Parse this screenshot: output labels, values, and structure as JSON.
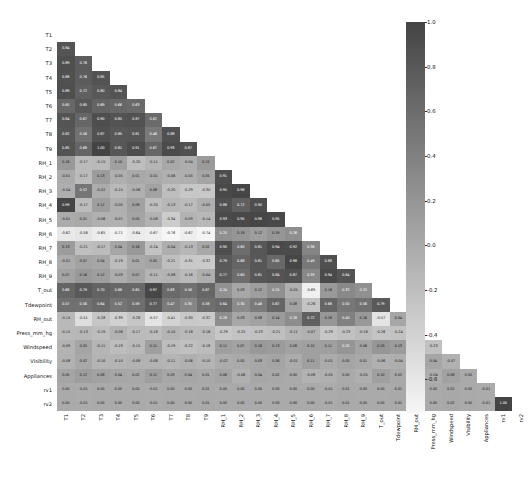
{
  "chart_data": {
    "type": "heatmap",
    "title": "",
    "xlabel": "",
    "ylabel": "",
    "mask": "lower-triangle",
    "annotated": true,
    "colormap": "grayscale-dark-high",
    "colorbar": {
      "vmin": -0.75,
      "vmax": 1.0,
      "ticks": [
        "1.0",
        "0.8",
        "0.6",
        "0.4",
        "0.2",
        "0.0",
        "-0.2",
        "-0.4",
        "-0.6"
      ],
      "tick_values": [
        1.0,
        0.8,
        0.6,
        0.4,
        0.2,
        0.0,
        -0.2,
        -0.4,
        -0.6
      ],
      "position": "right",
      "color_high": "#4a4a4a",
      "color_low": "#f2f2f2"
    },
    "categories": [
      "T1",
      "T2",
      "T3",
      "T4",
      "T5",
      "T6",
      "T7",
      "T8",
      "T9",
      "RH_1",
      "RH_2",
      "RH_3",
      "RH_4",
      "RH_5",
      "RH_6",
      "RH_7",
      "RH_8",
      "RH_9",
      "T_out",
      "Tdewpoint",
      "RH_out",
      "Press_mm_hg",
      "Windspeed",
      "Visibility",
      "Appliances",
      "rv1",
      "rv2"
    ],
    "matrix": [
      [
        null,
        null,
        null,
        null,
        null,
        null,
        null,
        null,
        null,
        null,
        null,
        null,
        null,
        null,
        null,
        null,
        null,
        null,
        null,
        null,
        null,
        null,
        null,
        null,
        null,
        null,
        null
      ],
      [
        0.84,
        null,
        null,
        null,
        null,
        null,
        null,
        null,
        null,
        null,
        null,
        null,
        null,
        null,
        null,
        null,
        null,
        null,
        null,
        null,
        null,
        null,
        null,
        null,
        null,
        null,
        null
      ],
      [
        0.89,
        0.76,
        null,
        null,
        null,
        null,
        null,
        null,
        null,
        null,
        null,
        null,
        null,
        null,
        null,
        null,
        null,
        null,
        null,
        null,
        null,
        null,
        null,
        null,
        null,
        null,
        null
      ],
      [
        0.88,
        0.76,
        0.85,
        null,
        null,
        null,
        null,
        null,
        null,
        null,
        null,
        null,
        null,
        null,
        null,
        null,
        null,
        null,
        null,
        null,
        null,
        null,
        null,
        null,
        null,
        null,
        null
      ],
      [
        0.89,
        0.72,
        0.8,
        0.84,
        null,
        null,
        null,
        null,
        null,
        null,
        null,
        null,
        null,
        null,
        null,
        null,
        null,
        null,
        null,
        null,
        null,
        null,
        null,
        null,
        null,
        null,
        null
      ],
      [
        0.65,
        0.8,
        0.69,
        0.66,
        0.63,
        null,
        null,
        null,
        null,
        null,
        null,
        null,
        null,
        null,
        null,
        null,
        null,
        null,
        null,
        null,
        null,
        null,
        null,
        null,
        null,
        null,
        null
      ],
      [
        0.84,
        0.67,
        0.9,
        0.85,
        0.87,
        0.62,
        null,
        null,
        null,
        null,
        null,
        null,
        null,
        null,
        null,
        null,
        null,
        null,
        null,
        null,
        null,
        null,
        null,
        null,
        null,
        null,
        null
      ],
      [
        0.82,
        0.56,
        0.87,
        0.8,
        0.81,
        0.48,
        0.88,
        null,
        null,
        null,
        null,
        null,
        null,
        null,
        null,
        null,
        null,
        null,
        null,
        null,
        null,
        null,
        null,
        null,
        null,
        null,
        null
      ],
      [
        0.85,
        0.68,
        1.0,
        0.81,
        0.91,
        0.67,
        0.93,
        0.87,
        null,
        null,
        null,
        null,
        null,
        null,
        null,
        null,
        null,
        null,
        null,
        null,
        null,
        null,
        null,
        null,
        null,
        null,
        null
      ],
      [
        0.16,
        -0.17,
        -0.15,
        0.1,
        -0.2,
        -0.11,
        0.02,
        -0.04,
        0.15,
        null,
        null,
        null,
        null,
        null,
        null,
        null,
        null,
        null,
        null,
        null,
        null,
        null,
        null,
        null,
        null,
        null,
        null
      ],
      [
        -0.01,
        -0.17,
        0.13,
        -0.05,
        0.01,
        -0.01,
        -0.06,
        -0.05,
        0.05,
        0.91,
        null,
        null,
        null,
        null,
        null,
        null,
        null,
        null,
        null,
        null,
        null,
        null,
        null,
        null,
        null,
        null,
        null
      ],
      [
        -0.04,
        0.52,
        -0.02,
        -0.15,
        -0.06,
        0.08,
        -0.2,
        -0.29,
        -0.3,
        0.95,
        0.98,
        null,
        null,
        null,
        null,
        null,
        null,
        null,
        null,
        null,
        null,
        null,
        null,
        null,
        null,
        null,
        null
      ],
      [
        0.99,
        -0.17,
        0.12,
        -0.05,
        0.09,
        -0.2,
        -0.13,
        -0.17,
        -0.05,
        0.88,
        0.72,
        0.9,
        null,
        null,
        null,
        null,
        null,
        null,
        null,
        null,
        null,
        null,
        null,
        null,
        null,
        null,
        null
      ],
      [
        -0.01,
        0.01,
        -0.06,
        -0.07,
        0.05,
        -0.08,
        -0.34,
        -0.09,
        -0.14,
        0.93,
        0.95,
        0.98,
        0.95,
        null,
        null,
        null,
        null,
        null,
        null,
        null,
        null,
        null,
        null,
        null,
        null,
        null,
        null
      ],
      [
        -0.62,
        -0.58,
        -0.65,
        -0.71,
        -0.64,
        -0.67,
        -0.76,
        -0.67,
        -0.74,
        0.25,
        0.19,
        0.12,
        0.19,
        0.26,
        null,
        null,
        null,
        null,
        null,
        null,
        null,
        null,
        null,
        null,
        null,
        null,
        null
      ],
      [
        0.13,
        -0.21,
        -0.17,
        0.04,
        0.16,
        -0.24,
        -0.04,
        -0.13,
        0.02,
        0.9,
        0.6,
        0.81,
        0.94,
        0.92,
        0.36,
        null,
        null,
        null,
        null,
        null,
        null,
        null,
        null,
        null,
        null,
        null,
        null
      ],
      [
        -0.01,
        0.07,
        0.04,
        -0.19,
        0.01,
        0.05,
        -0.21,
        -0.31,
        -0.32,
        0.79,
        0.68,
        0.81,
        0.65,
        0.98,
        0.49,
        0.88,
        null,
        null,
        null,
        null,
        null,
        null,
        null,
        null,
        null,
        null,
        null
      ],
      [
        0.07,
        0.16,
        0.12,
        -0.03,
        0.07,
        -0.11,
        -0.08,
        -0.16,
        -0.04,
        0.77,
        0.6,
        0.81,
        0.84,
        0.87,
        0.33,
        0.94,
        0.84,
        null,
        null,
        null,
        null,
        null,
        null,
        null,
        null,
        null,
        null
      ],
      [
        0.68,
        0.79,
        0.7,
        0.66,
        0.65,
        0.97,
        0.63,
        0.56,
        0.67,
        0.24,
        0.03,
        0.12,
        0.25,
        -0.05,
        -0.69,
        0.16,
        0.32,
        0.25,
        null,
        null,
        null,
        null,
        null,
        null,
        null,
        null,
        null
      ],
      [
        0.57,
        0.56,
        0.64,
        0.52,
        0.59,
        0.77,
        0.47,
        0.35,
        0.58,
        0.64,
        0.3,
        0.46,
        0.67,
        0.08,
        -0.26,
        0.68,
        0.5,
        0.56,
        0.79,
        null,
        null,
        null,
        null,
        null,
        null,
        null,
        null
      ],
      [
        -0.15,
        -0.51,
        -0.28,
        -0.39,
        -0.28,
        -0.57,
        -0.41,
        -0.3,
        -0.32,
        0.28,
        0.03,
        0.08,
        0.14,
        0.28,
        0.72,
        0.18,
        0.4,
        0.16,
        -0.57,
        0.04,
        null,
        null,
        null,
        null,
        null,
        null,
        null
      ],
      [
        -0.15,
        -0.13,
        -0.19,
        -0.08,
        -0.17,
        -0.18,
        -0.1,
        -0.16,
        -0.16,
        -0.29,
        -0.25,
        -0.23,
        -0.21,
        -0.11,
        -0.07,
        -0.29,
        -0.23,
        -0.18,
        -0.26,
        -0.24,
        -0.09,
        null,
        null,
        null,
        null,
        null,
        null
      ],
      [
        -0.09,
        0.05,
        -0.11,
        -0.19,
        -0.15,
        0.11,
        -0.19,
        -0.22,
        -0.18,
        0.11,
        0.07,
        0.16,
        0.13,
        0.08,
        0.1,
        0.11,
        0.2,
        0.06,
        0.19,
        0.13,
        -0.18,
        -0.23,
        null,
        null,
        null,
        null,
        null
      ],
      [
        -0.08,
        0.02,
        -0.1,
        -0.1,
        -0.08,
        -0.08,
        -0.11,
        -0.06,
        -0.1,
        -0.02,
        -0.0,
        0.03,
        0.06,
        -0.01,
        0.11,
        -0.01,
        0.05,
        0.01,
        -0.06,
        -0.04,
        0.0,
        0.04,
        -0.07,
        null,
        null,
        null,
        null
      ],
      [
        0.05,
        0.12,
        0.08,
        0.04,
        0.02,
        0.11,
        0.03,
        0.04,
        0.01,
        0.06,
        -0.06,
        0.04,
        0.02,
        0.0,
        -0.08,
        -0.05,
        0.0,
        -0.05,
        0.1,
        0.02,
        -0.15,
        -0.04,
        0.08,
        0.0,
        null,
        null,
        null
      ],
      [
        -0.0,
        -0.01,
        0.0,
        0.0,
        -0.0,
        -0.01,
        0.0,
        0.0,
        0.01,
        0.0,
        0.0,
        -0.0,
        -0.0,
        -0.0,
        0.0,
        -0.01,
        0.01,
        0.0,
        0.0,
        0.01,
        -0.01,
        0.0,
        0.02,
        0.0,
        -0.01,
        null,
        null
      ],
      [
        -0.0,
        -0.01,
        0.0,
        0.0,
        -0.0,
        -0.01,
        0.0,
        0.0,
        0.01,
        0.0,
        0.0,
        -0.0,
        -0.0,
        -0.0,
        0.0,
        -0.01,
        0.01,
        0.0,
        0.0,
        0.01,
        -0.01,
        0.0,
        0.02,
        0.0,
        -0.01,
        1.0,
        null
      ]
    ]
  }
}
